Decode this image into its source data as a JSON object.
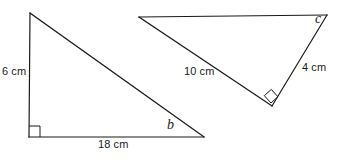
{
  "figure": {
    "background_color": "#ffffff",
    "stroke_color": "#1a1a1a",
    "width": 338,
    "height": 160
  },
  "shapes": [
    {
      "name": "left-triangle",
      "kind": "right-triangle",
      "vertices": [
        {
          "name": "apex",
          "x": 30,
          "y": 13
        },
        {
          "name": "right-angle-corner",
          "x": 29,
          "y": 137
        },
        {
          "name": "angle-b-corner",
          "x": 204,
          "y": 137
        }
      ],
      "right_angle_at": "right-angle-corner",
      "sides": [
        {
          "name": "vertical-leg",
          "label": "6 cm",
          "value": 6,
          "unit": "cm"
        },
        {
          "name": "horizontal-leg",
          "label": "18 cm",
          "value": 18,
          "unit": "cm"
        }
      ],
      "angles": [
        {
          "name": "angle-b",
          "label": "b",
          "known": false
        }
      ]
    },
    {
      "name": "right-triangle",
      "kind": "right-triangle",
      "vertices": [
        {
          "name": "left-vertex",
          "x": 139,
          "y": 17
        },
        {
          "name": "angle-c-vertex",
          "x": 327,
          "y": 15
        },
        {
          "name": "right-angle-vertex",
          "x": 272,
          "y": 106
        }
      ],
      "right_angle_at": "right-angle-vertex",
      "sides": [
        {
          "name": "long-leg",
          "label": "10 cm",
          "value": 10,
          "unit": "cm"
        },
        {
          "name": "short-leg",
          "label": "4 cm",
          "value": 4,
          "unit": "cm"
        }
      ],
      "angles": [
        {
          "name": "angle-c",
          "label": "c",
          "known": false
        }
      ]
    }
  ],
  "labels": {
    "left_triangle_vertical": "6 cm",
    "left_triangle_horizontal": "18 cm",
    "left_triangle_angle": "b",
    "right_triangle_long_side": "10 cm",
    "right_triangle_short_side": "4 cm",
    "right_triangle_angle": "c"
  }
}
